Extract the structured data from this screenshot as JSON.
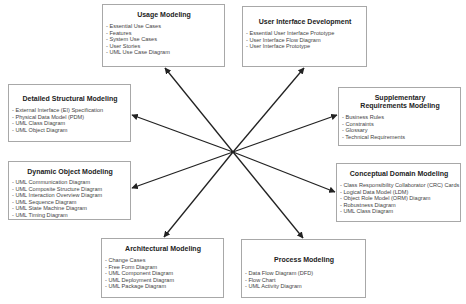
{
  "diagram": {
    "center": {
      "x": 233,
      "y": 152
    },
    "line_color": "#222222",
    "border_color": "#a8a8a8",
    "boxes": [
      {
        "id": "usage",
        "title": "Usage Modeling",
        "items": [
          "Essential Use Cases",
          "Features",
          "System Use Cases",
          "User Stories",
          "UML Use Case Diagram"
        ],
        "rect": {
          "x": 102,
          "y": 4,
          "w": 123,
          "h": 63
        },
        "arrow_tip": {
          "x": 165,
          "y": 68
        }
      },
      {
        "id": "ui",
        "title": "User Interface Development",
        "items": [
          "Essential User Interface Prototype",
          "User Interface Flow Diagram",
          "User Interface Prototype"
        ],
        "rect": {
          "x": 242,
          "y": 6,
          "w": 125,
          "h": 61
        },
        "arrow_tip": {
          "x": 304,
          "y": 68
        }
      },
      {
        "id": "structural",
        "title": "Detailed Structural Modeling",
        "items": [
          "External Interface (EI) Specification",
          "Physical Data Model (PDM)",
          "UML Class Diagram",
          "UML Object Diagram"
        ],
        "rect": {
          "x": 8,
          "y": 84,
          "w": 123,
          "h": 58
        },
        "arrow_tip": {
          "x": 132,
          "y": 115
        }
      },
      {
        "id": "supplementary",
        "title": "Supplementary Requirements Modeling",
        "items": [
          "Business Rules",
          "Constraints",
          "Glossary",
          "Technical Requirements"
        ],
        "rect": {
          "x": 338,
          "y": 87,
          "w": 123,
          "h": 59
        },
        "arrow_tip": {
          "x": 337,
          "y": 115
        }
      },
      {
        "id": "dynamic",
        "title": "Dynamic Object Modeling",
        "items": [
          "UML Communication Diagram",
          "UML Composite Structure Diagram",
          "UML Interaction Overview Diagram",
          "UML Sequence Diagram",
          "UML State Machine Diagram",
          "UML Timing Diagram"
        ],
        "rect": {
          "x": 8,
          "y": 161,
          "w": 123,
          "h": 59
        },
        "arrow_tip": {
          "x": 132,
          "y": 188
        }
      },
      {
        "id": "conceptual",
        "title": "Conceptual Domain Modeling",
        "items": [
          "Class Responsibility Collaborator (CRC) Cards",
          "Logical Data Model (LDM)",
          "Object Role Model (ORM) Diagram",
          "Robustness Diagram",
          "UML Class Diagram"
        ],
        "rect": {
          "x": 336,
          "y": 163,
          "w": 125,
          "h": 59
        },
        "arrow_tip": {
          "x": 335,
          "y": 192
        }
      },
      {
        "id": "architectural",
        "title": "Architectural Modeling",
        "items": [
          "Change Cases",
          "Free Form Diagram",
          "UML Component Diagram",
          "UML Deployment Diagram",
          "UML Package Diagram"
        ],
        "rect": {
          "x": 101,
          "y": 238,
          "w": 123,
          "h": 60
        },
        "arrow_tip": {
          "x": 164,
          "y": 237
        }
      },
      {
        "id": "process",
        "title": "Process Modeling",
        "items": [
          "Data Flow Diagram (DFD)",
          "Flow Chart",
          "UML Activity Diagram"
        ],
        "rect": {
          "x": 241,
          "y": 239,
          "w": 125,
          "h": 59
        },
        "arrow_tip": {
          "x": 303,
          "y": 238
        }
      }
    ]
  }
}
